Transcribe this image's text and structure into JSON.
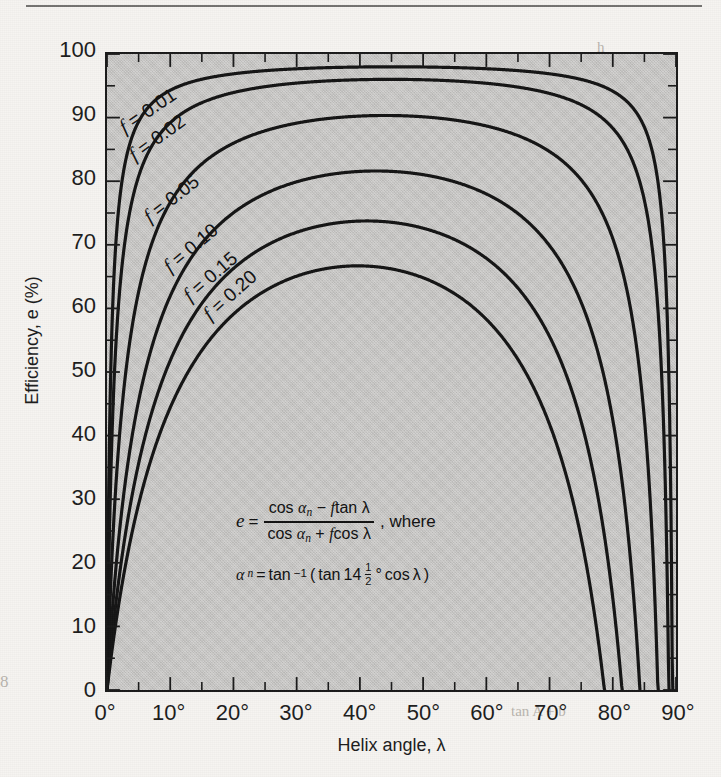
{
  "page": {
    "background_color": "#f6f4f1",
    "plot_background_color": "#c9c8c6",
    "ink_color": "#141414",
    "folio": "8",
    "ghost_text": {
      "b1": "h",
      "b2": "gh a",
      "b3": "Fig",
      "b4": "tan A + b"
    }
  },
  "chart_data": {
    "type": "line",
    "title": "",
    "xlabel": "Helix angle, λ",
    "ylabel": "Efficiency, e (%)",
    "xlim": [
      0,
      90
    ],
    "ylim": [
      0,
      100
    ],
    "x_unit": "degrees",
    "y_unit": "percent",
    "grid": false,
    "legend_position": "inline-labels",
    "x_tick_labels": [
      "0°",
      "10°",
      "20°",
      "30°",
      "40°",
      "50°",
      "60°",
      "70°",
      "80°",
      "90°"
    ],
    "x_tick_values": [
      0,
      10,
      20,
      30,
      40,
      50,
      60,
      70,
      80,
      90
    ],
    "x_minor_step": 5,
    "y_tick_labels": [
      "0",
      "10",
      "20",
      "30",
      "40",
      "50",
      "60",
      "70",
      "80",
      "90",
      "100"
    ],
    "y_tick_values": [
      0,
      10,
      20,
      30,
      40,
      50,
      60,
      70,
      80,
      90,
      100
    ],
    "y_minor_step": 5,
    "x": [
      0,
      1,
      2,
      3,
      4,
      5,
      7.5,
      10,
      12.5,
      15,
      20,
      25,
      30,
      35,
      40,
      45,
      50,
      55,
      60,
      65,
      70,
      75,
      80,
      85,
      88,
      90
    ],
    "series": [
      {
        "name": "f = 0.01",
        "f": 0.01,
        "label": "f = 0.01",
        "peak_value": 97.9,
        "peak_angle": 45,
        "zero_crossing_deg": 89.4,
        "values": [
          0,
          63.3,
          77.2,
          83.4,
          86.9,
          89.1,
          92.3,
          94.0,
          95.1,
          95.8,
          96.8,
          97.3,
          97.6,
          97.8,
          97.9,
          97.9,
          97.9,
          97.8,
          97.6,
          97.3,
          96.8,
          95.8,
          93.7,
          87.4,
          78.0,
          0
        ]
      },
      {
        "name": "f = 0.02",
        "f": 0.02,
        "label": "f = 0.02",
        "peak_value": 95.8,
        "peak_angle": 45,
        "zero_crossing_deg": 88.8,
        "values": [
          0,
          46.3,
          63.3,
          71.9,
          77.2,
          80.7,
          86.1,
          89.1,
          91.0,
          92.3,
          93.9,
          94.8,
          95.3,
          95.6,
          95.8,
          95.8,
          95.8,
          95.6,
          95.2,
          94.5,
          93.5,
          91.5,
          87.6,
          76.7,
          62.3,
          0
        ]
      },
      {
        "name": "f = 0.05",
        "f": 0.05,
        "label": "f = 0.05",
        "peak_value": 90.0,
        "peak_angle": 44,
        "zero_crossing_deg": 87.1,
        "values": [
          0,
          25.1,
          40.0,
          50.1,
          57.3,
          62.7,
          71.9,
          77.4,
          81.0,
          83.5,
          86.6,
          88.3,
          89.3,
          89.8,
          90.0,
          90.0,
          89.8,
          89.3,
          88.4,
          87.1,
          84.9,
          81.1,
          73.7,
          55.1,
          35.5,
          0
        ]
      },
      {
        "name": "f = 0.10",
        "f": 0.1,
        "label": "f = 0.10",
        "peak_value": 81.6,
        "peak_angle": 43,
        "zero_crossing_deg": 84.3,
        "values": [
          0,
          14.3,
          25.1,
          33.3,
          40.0,
          45.5,
          55.6,
          62.6,
          67.6,
          71.3,
          76.0,
          78.8,
          80.4,
          81.3,
          81.6,
          81.5,
          81.1,
          80.2,
          78.7,
          76.3,
          72.6,
          66.4,
          55.0,
          30.9,
          11.8,
          0
        ]
      },
      {
        "name": "f = 0.15",
        "f": 0.15,
        "label": "f = 0.15",
        "peak_value": 73.8,
        "peak_angle": 41,
        "zero_crossing_deg": 81.5,
        "values": [
          0,
          10.0,
          18.3,
          25.1,
          30.9,
          35.9,
          45.5,
          52.6,
          58.0,
          62.2,
          67.9,
          71.3,
          73.2,
          73.9,
          73.8,
          73.2,
          71.9,
          70.0,
          67.3,
          63.4,
          57.8,
          49.2,
          34.8,
          8.9,
          0,
          0
        ]
      },
      {
        "name": "f = 0.20",
        "f": 0.2,
        "label": "f = 0.20",
        "peak_value": 66.7,
        "peak_angle": 39,
        "zero_crossing_deg": 78.7,
        "values": [
          0,
          7.7,
          14.4,
          20.2,
          25.2,
          29.7,
          38.5,
          45.2,
          50.5,
          54.7,
          60.8,
          64.4,
          66.3,
          66.9,
          66.7,
          65.7,
          64.0,
          61.4,
          57.9,
          53.1,
          46.3,
          36.4,
          20.1,
          0,
          0,
          0
        ]
      }
    ],
    "annotation": {
      "equation_line1_lhs": "e",
      "equation_line1_eq": "=",
      "equation_numerator": "cos αn − f tan λ",
      "equation_denominator": "cos αn + f cos λ",
      "equation_line1_suffix": ", where",
      "equation_line2": "αn = tan⁻¹ (tan 14½° cos λ)",
      "tokens": {
        "cos": "cos",
        "tan": "tan",
        "alpha": "α",
        "n": "n",
        "f": "f",
        "lambda": "λ",
        "minus": "−",
        "plus": "+",
        "equals": "=",
        "where": ", where",
        "inv_sup": "−1",
        "num14": "14",
        "half_num": "1",
        "half_den": "2",
        "degree": "°",
        "open_paren": "(",
        "close_paren": ")"
      }
    }
  }
}
